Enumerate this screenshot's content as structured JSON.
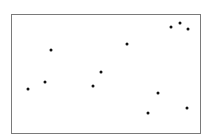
{
  "chart_data": {
    "type": "scatter",
    "title": "",
    "xlabel": "",
    "ylabel": "",
    "xlim": [
      0,
      100
    ],
    "ylim": [
      0,
      100
    ],
    "grid": false,
    "legend": null,
    "marker_color": "#111111",
    "frame_color": "#7a7a7a",
    "points": [
      {
        "x": 8.5,
        "y": 37.0
      },
      {
        "x": 17.5,
        "y": 43.0
      },
      {
        "x": 20.6,
        "y": 70.6
      },
      {
        "x": 42.9,
        "y": 39.5
      },
      {
        "x": 47.1,
        "y": 52.1
      },
      {
        "x": 61.4,
        "y": 75.6
      },
      {
        "x": 72.5,
        "y": 16.8
      },
      {
        "x": 77.8,
        "y": 33.6
      },
      {
        "x": 84.7,
        "y": 89.9
      },
      {
        "x": 89.4,
        "y": 93.3
      },
      {
        "x": 93.7,
        "y": 88.2
      },
      {
        "x": 93.1,
        "y": 21.0
      }
    ]
  }
}
